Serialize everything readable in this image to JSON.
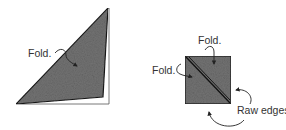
{
  "colors": {
    "paper_fill": "#6e6e6e",
    "paper_dark": "#4a4a4a",
    "outline": "#1a1a1a",
    "under_paper": "#ffffff",
    "arrow": "#222222",
    "text": "#333333"
  },
  "figure_left": {
    "shape": "folded-triangle",
    "labels": [
      {
        "id": "fold",
        "text": "Fold."
      }
    ]
  },
  "figure_right": {
    "shape": "folded-square-with-diagonal",
    "labels": [
      {
        "id": "fold-top",
        "text": "Fold."
      },
      {
        "id": "fold-left",
        "text": "Fold."
      },
      {
        "id": "raw-edges",
        "text": "Raw edges"
      }
    ]
  }
}
